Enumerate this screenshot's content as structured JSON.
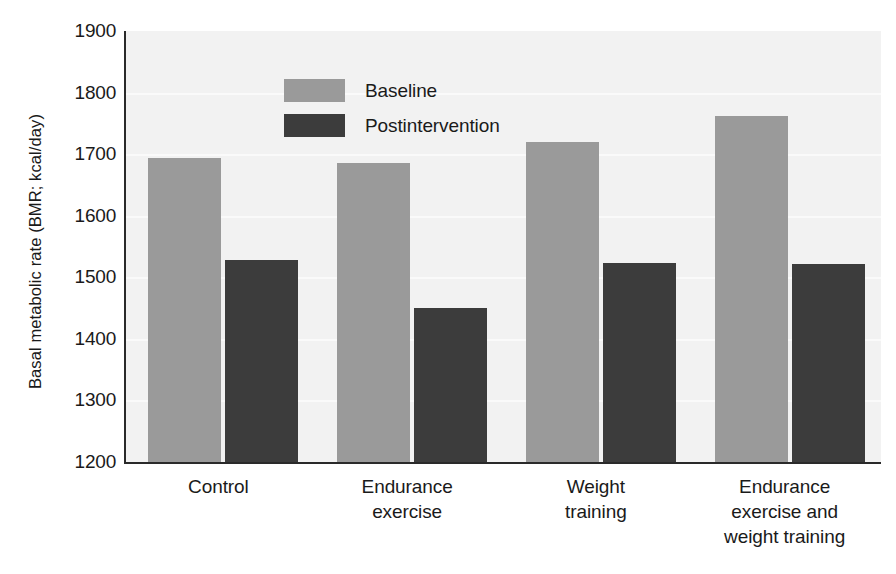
{
  "chart_data": {
    "type": "bar",
    "title": "",
    "xlabel": "",
    "ylabel": "Basal metabolic rate (BMR; kcal/day)",
    "ylim": [
      1200,
      1900
    ],
    "ytick_step": 100,
    "yticks": [
      1900,
      1800,
      1700,
      1600,
      1500,
      1400,
      1300,
      1200
    ],
    "ytick_labels": [
      "1900",
      "1800",
      "1700",
      "1600",
      "1500",
      "1400",
      "1300",
      "1200"
    ],
    "grid": true,
    "grid_axis": "y",
    "legend_position": "upper-left-inside",
    "categories": [
      "Control",
      "Endurance exercise",
      "Weight training",
      "Endurance exercise and weight training"
    ],
    "category_label_lines": [
      [
        "Control"
      ],
      [
        "Endurance",
        "exercise"
      ],
      [
        "Weight",
        "training"
      ],
      [
        "Endurance",
        "exercise and",
        "weight training"
      ]
    ],
    "series": [
      {
        "name": "Baseline",
        "color": "#9a9a9a",
        "values": [
          1693,
          1685,
          1719,
          1762
        ]
      },
      {
        "name": "Postintervention",
        "color": "#3c3c3c",
        "values": [
          1528,
          1450,
          1523,
          1522
        ]
      }
    ],
    "plot_background_color": "#f2f2f2",
    "axis_color": "#2a2a2a",
    "gridline_color": "#fafafa"
  },
  "legend": {
    "items": [
      {
        "label": "Baseline"
      },
      {
        "label": "Postintervention"
      }
    ]
  }
}
